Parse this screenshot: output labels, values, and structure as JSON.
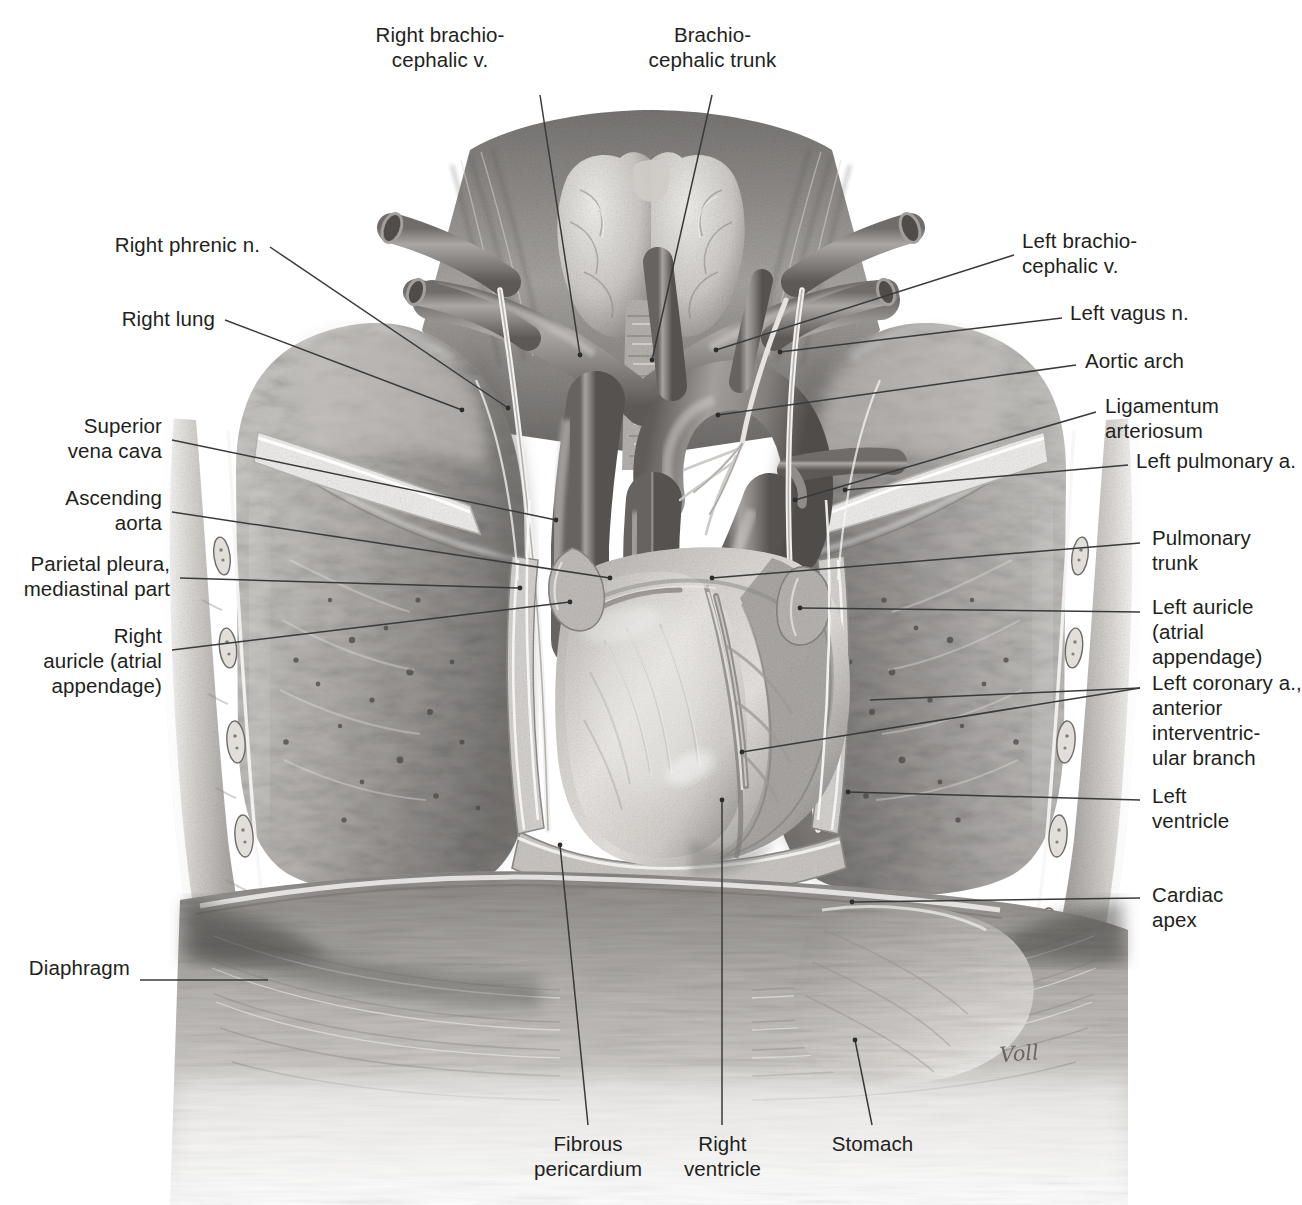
{
  "figure": {
    "signature": "Voll",
    "background_color": "#ffffff",
    "text_color": "#231f20",
    "leader_color": "#3a3a3a",
    "caption": ""
  },
  "labels": {
    "right_brachiocephalic_vein": "Right brachio-\ncephalic v.",
    "brachiocephalic_trunk": "Brachio-\ncephalic trunk",
    "right_phrenic_nerve": "Right phrenic n.",
    "right_lung": "Right lung",
    "superior_vena_cava": "Superior\nvena cava",
    "ascending_aorta": "Ascending\naorta",
    "parietal_pleura": "Parietal pleura,\nmediastinal part",
    "right_auricle": "Right\nauricle (atrial\nappendage)",
    "diaphragm": "Diaphragm",
    "left_brachiocephalic_vein": "Left brachio-\ncephalic v.",
    "left_vagus_nerve": "Left vagus n.",
    "aortic_arch": "Aortic arch",
    "ligamentum_arteriosum": "Ligamentum\narteriosum",
    "left_pulmonary_artery": "Left pulmonary a.",
    "pulmonary_trunk": "Pulmonary\ntrunk",
    "left_auricle": "Left auricle\n(atrial\nappendage)",
    "left_coronary_artery": "Left coronary a.,\nanterior\ninterventric-\nular branch",
    "left_ventricle": "Left\nventricle",
    "cardiac_apex": "Cardiac\napex",
    "fibrous_pericardium": "Fibrous\npericardium",
    "right_ventricle": "Right\nventricle",
    "stomach": "Stomach"
  }
}
